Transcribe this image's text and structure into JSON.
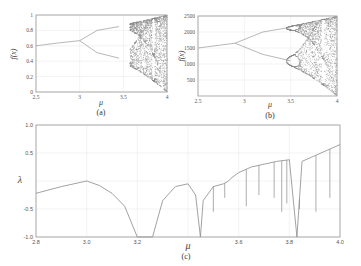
{
  "chart_data": [
    {
      "id": "a",
      "type": "scatter",
      "caption": "(a)",
      "title": "",
      "xlabel": "μ",
      "ylabel": "f(x)",
      "xlim": [
        2.5,
        4
      ],
      "ylim": [
        0,
        1
      ],
      "xticks": [
        "2.5",
        "3",
        "3.5",
        "4"
      ],
      "yticks": [
        "0",
        "0.2",
        "0.4",
        "0.6",
        "0.8",
        "1"
      ],
      "grid": true,
      "description": "Bifurcation diagram of logistic map: single fixed point up to μ≈3, period-doubling to 2 branches, chaos beyond μ≈3.57",
      "branches": [
        {
          "name": "fixed point",
          "x": [
            2.5,
            2.75,
            3.0
          ],
          "y": [
            0.6,
            0.636,
            0.667
          ]
        },
        {
          "name": "upper branch",
          "x": [
            3.0,
            3.2,
            3.45
          ],
          "y": [
            0.667,
            0.8,
            0.85
          ]
        },
        {
          "name": "lower branch",
          "x": [
            3.0,
            3.2,
            3.45
          ],
          "y": [
            0.667,
            0.51,
            0.44
          ]
        }
      ],
      "chaos_region": {
        "x_start": 3.57,
        "x_end": 4.0,
        "y_min": 0.0,
        "y_max": 1.0
      }
    },
    {
      "id": "b",
      "type": "scatter",
      "caption": "(b)",
      "title": "",
      "xlabel": "μ",
      "ylabel": "f(x)",
      "xlim": [
        2.5,
        4
      ],
      "ylim": [
        0,
        2500
      ],
      "xticks": [
        "2.5",
        "3",
        "3.5",
        "4"
      ],
      "yticks": [
        "500",
        "1000",
        "1500",
        "2000",
        "2500"
      ],
      "grid": true,
      "description": "Scaled bifurcation diagram: single branch to μ≈2.9, splits into two, chaos beyond μ≈3.5",
      "branches": [
        {
          "name": "fixed point",
          "x": [
            2.5,
            2.9
          ],
          "y": [
            1500,
            1650
          ]
        },
        {
          "name": "upper branch",
          "x": [
            2.9,
            3.2,
            3.5
          ],
          "y": [
            1650,
            2000,
            2150
          ]
        },
        {
          "name": "lower branch",
          "x": [
            2.9,
            3.2,
            3.5
          ],
          "y": [
            1650,
            1300,
            1100
          ]
        }
      ],
      "chaos_region": {
        "x_start": 3.45,
        "x_end": 4.0,
        "y_min": 0,
        "y_max": 2500
      }
    },
    {
      "id": "c",
      "type": "line",
      "caption": "(c)",
      "title": "",
      "xlabel": "μ",
      "ylabel": "λ",
      "xlim": [
        2.8,
        4.0
      ],
      "ylim": [
        -1.0,
        1.0
      ],
      "xticks": [
        "2.8",
        "3.0",
        "3.2",
        "3.4",
        "3.6",
        "3.8",
        "4.0"
      ],
      "yticks": [
        "1.0",
        "0.5",
        "0",
        "-0.5",
        "-1.0"
      ],
      "grid": true,
      "description": "Lyapunov exponent vs μ",
      "x": [
        2.8,
        2.9,
        3.0,
        3.05,
        3.1,
        3.15,
        3.2,
        3.22,
        3.24,
        3.26,
        3.3,
        3.35,
        3.4,
        3.43,
        3.449,
        3.46,
        3.5,
        3.54,
        3.56,
        3.57,
        3.6,
        3.65,
        3.7,
        3.75,
        3.8,
        3.83,
        3.85,
        3.9,
        3.95,
        4.0
      ],
      "y": [
        -0.22,
        -0.1,
        0.0,
        -0.08,
        -0.22,
        -0.45,
        -1.0,
        -1.0,
        -1.0,
        -1.0,
        -0.35,
        -0.1,
        -0.05,
        -0.25,
        -1.0,
        -0.35,
        -0.1,
        -0.05,
        0.0,
        0.05,
        0.15,
        0.25,
        0.3,
        0.35,
        0.38,
        -1.0,
        0.35,
        0.45,
        0.55,
        0.65
      ],
      "dips": [
        {
          "x": 3.5,
          "y": -0.55
        },
        {
          "x": 3.545,
          "y": -0.3
        },
        {
          "x": 3.63,
          "y": -0.45
        },
        {
          "x": 3.68,
          "y": -0.25
        },
        {
          "x": 3.74,
          "y": -0.3
        },
        {
          "x": 3.77,
          "y": -0.55
        },
        {
          "x": 3.79,
          "y": -0.4
        },
        {
          "x": 3.84,
          "y": -0.5
        },
        {
          "x": 3.905,
          "y": -0.55
        },
        {
          "x": 3.96,
          "y": -0.3
        }
      ]
    }
  ]
}
